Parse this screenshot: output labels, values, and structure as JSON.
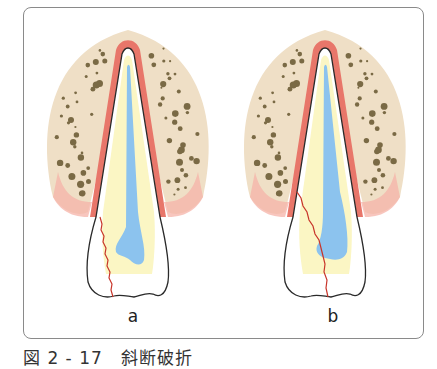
{
  "figure": {
    "caption": "図 2 - 17　斜断破折",
    "panels": [
      {
        "label": "a",
        "fracture": "oblique crown-root fracture ending at incisal edge, left side"
      },
      {
        "label": "b",
        "fracture": "oblique crown-root fracture crossing pulp, ending at incisal edge"
      }
    ]
  },
  "colors": {
    "bone": "#efdfc6",
    "bone_dots": "#7a6a45",
    "periodontal": "#e8766a",
    "gingiva_fade": "#f6b3a8",
    "dentin": "#fbf6c4",
    "pulp": "#8cc3ee",
    "outline": "#2a2a2a",
    "fracture": "#c8352a",
    "frame": "#8a8a8a"
  }
}
